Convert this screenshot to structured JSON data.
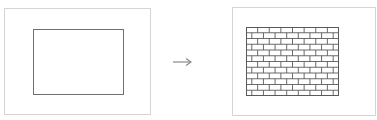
{
  "diagram": {
    "left": {
      "label": "",
      "shape": "plain-rectangle"
    },
    "arrow": {
      "direction": "right",
      "symbol": "→"
    },
    "right": {
      "label": "",
      "shape": "brick-pattern-rectangle",
      "rows": 12,
      "bricks_per_row": 8
    },
    "colors": {
      "frame": "#d4d4d4",
      "stroke": "#6f6f6f",
      "arrow": "#8a8a8a",
      "background": "#ffffff"
    }
  }
}
